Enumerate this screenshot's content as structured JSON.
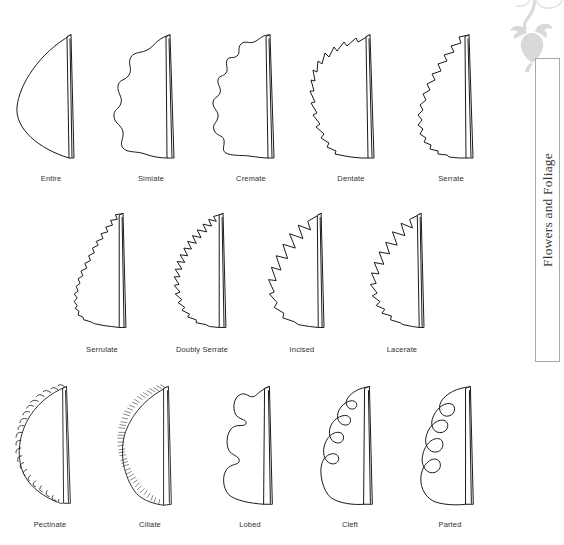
{
  "figure": {
    "rows": [
      {
        "items": [
          {
            "label": "Entire",
            "shape": "entire"
          },
          {
            "label": "Simiate",
            "shape": "sinuate"
          },
          {
            "label": "Cremate",
            "shape": "crenate"
          },
          {
            "label": "Dentate",
            "shape": "dentate"
          },
          {
            "label": "Serrate",
            "shape": "serrate"
          }
        ]
      },
      {
        "items": [
          {
            "label": "Serrulate",
            "shape": "serrulate"
          },
          {
            "label": "Doubly Serrate",
            "shape": "doubly-serrate"
          },
          {
            "label": "Incised",
            "shape": "incised"
          },
          {
            "label": "Lacerate",
            "shape": "lacerate"
          }
        ]
      },
      {
        "items": [
          {
            "label": "Pectinate",
            "shape": "pectinate"
          },
          {
            "label": "Ciliate",
            "shape": "ciliate"
          },
          {
            "label": "Lobed",
            "shape": "lobed"
          },
          {
            "label": "Cleft",
            "shape": "cleft"
          },
          {
            "label": "Parted",
            "shape": "parted"
          }
        ]
      }
    ]
  },
  "sidebar": {
    "title": "Flowers and Foliage",
    "ornament_name": "floral-vine-ornament",
    "ornament_color": "#d8d8d8",
    "box_border_color": "#a8a8a8"
  },
  "colors": {
    "ink": "#1a1a1a",
    "label_text": "#303030",
    "sidebar_text": "#3a3a3a",
    "background": "#ffffff"
  }
}
